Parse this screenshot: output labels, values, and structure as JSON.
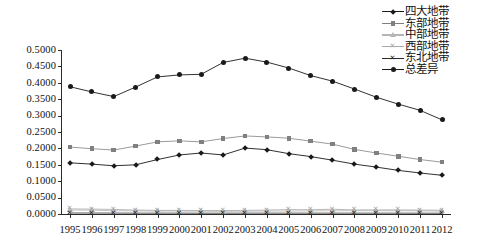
{
  "chart_data": {
    "type": "line",
    "title": "",
    "xlabel": "",
    "ylabel": "",
    "x": [
      1995,
      1996,
      1997,
      1998,
      1999,
      2000,
      2001,
      2002,
      2003,
      2004,
      2005,
      2006,
      2007,
      2008,
      2009,
      2010,
      2011,
      2012
    ],
    "ylim": [
      0.0,
      0.5
    ],
    "ytick_labels": [
      "0.5000",
      "0.4500",
      "0.4000",
      "0.3500",
      "0.3000",
      "0.2500",
      "0.2000",
      "0.1500",
      "0.1000",
      "0.0500",
      "0.0000"
    ],
    "ytick_values": [
      0.5,
      0.45,
      0.4,
      0.35,
      0.3,
      0.25,
      0.2,
      0.15,
      0.1,
      0.05,
      0.0
    ],
    "xtick_labels": [
      "1995",
      "1996",
      "1997",
      "1998",
      "1999",
      "2000",
      "2001",
      "2002",
      "2003",
      "2004",
      "2005",
      "2006",
      "2007",
      "2008",
      "2009",
      "2010",
      "2011",
      "2012"
    ],
    "grid": false,
    "legend_position": "top-right",
    "series": [
      {
        "name": "四大地带",
        "marker": "diamond",
        "color": "#1a1a1a",
        "values": [
          0.156,
          0.152,
          0.147,
          0.15,
          0.166,
          0.18,
          0.186,
          0.18,
          0.201,
          0.196,
          0.184,
          0.175,
          0.164,
          0.152,
          0.143,
          0.133,
          0.125,
          0.118
        ]
      },
      {
        "name": "东部地带",
        "marker": "square",
        "color": "#808080",
        "values": [
          0.204,
          0.199,
          0.195,
          0.207,
          0.22,
          0.223,
          0.22,
          0.23,
          0.238,
          0.235,
          0.231,
          0.222,
          0.213,
          0.197,
          0.186,
          0.176,
          0.166,
          0.158
        ]
      },
      {
        "name": "中部地带",
        "marker": "triangle",
        "color": "#b5b5b5",
        "values": [
          0.012,
          0.0115,
          0.01,
          0.0095,
          0.009,
          0.009,
          0.0085,
          0.008,
          0.0085,
          0.009,
          0.009,
          0.0095,
          0.01,
          0.01,
          0.01,
          0.01,
          0.0095,
          0.009
        ]
      },
      {
        "name": "西部地带",
        "marker": "cross-light",
        "color": "#a8a8a8",
        "values": [
          0.0155,
          0.015,
          0.014,
          0.012,
          0.011,
          0.011,
          0.0105,
          0.0105,
          0.011,
          0.012,
          0.0135,
          0.013,
          0.0145,
          0.0125,
          0.0125,
          0.0125,
          0.012,
          0.0115
        ]
      },
      {
        "name": "东北地带",
        "marker": "cross-dark",
        "color": "#2b2b2b",
        "values": [
          0.003,
          0.003,
          0.0028,
          0.0026,
          0.0026,
          0.0026,
          0.0024,
          0.0024,
          0.0026,
          0.0026,
          0.0026,
          0.0026,
          0.0026,
          0.0026,
          0.0026,
          0.0026,
          0.0024,
          0.0024
        ]
      },
      {
        "name": "总差异",
        "marker": "circle",
        "color": "#1a1a1a",
        "values": [
          0.388,
          0.372,
          0.358,
          0.387,
          0.418,
          0.424,
          0.426,
          0.462,
          0.475,
          0.463,
          0.445,
          0.422,
          0.405,
          0.381,
          0.356,
          0.335,
          0.316,
          0.287
        ]
      }
    ]
  },
  "legend": {
    "items": [
      {
        "label": "四大地带"
      },
      {
        "label": "东部地带"
      },
      {
        "label": "中部地带"
      },
      {
        "label": "西部地带"
      },
      {
        "label": "东北地带"
      },
      {
        "label": "总差异"
      }
    ]
  }
}
